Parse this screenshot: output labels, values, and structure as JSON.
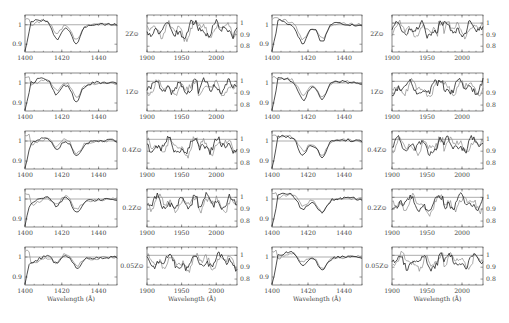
{
  "header": {
    "running_title": "",
    "page_number": ""
  },
  "chart_data": {
    "type": "line",
    "rows": [
      "2Z⊙",
      "1Z⊙",
      "0.4Z⊙",
      "0.2Z⊙",
      "0.05Z⊙"
    ],
    "columns": [
      {
        "window": "short",
        "xlim": [
          1400,
          1450
        ],
        "xticks": [
          1400,
          1420,
          1440
        ],
        "ylim": [
          0.86,
          1.05
        ],
        "yticks": [
          0.9,
          1
        ],
        "ytick_side": "left"
      },
      {
        "window": "long",
        "xlim": [
          1900,
          2030
        ],
        "xticks": [
          1900,
          1950,
          2000
        ],
        "ylim": [
          0.75,
          1.07
        ],
        "yticks": [
          0.8,
          0.9,
          1
        ],
        "ytick_side": "right"
      },
      {
        "window": "short",
        "xlim": [
          1400,
          1450
        ],
        "xticks": [
          1400,
          1420,
          1440
        ],
        "ylim": [
          0.86,
          1.05
        ],
        "yticks": [
          0.9,
          1
        ],
        "ytick_side": "left"
      },
      {
        "window": "long",
        "xlim": [
          1900,
          2030
        ],
        "xticks": [
          1900,
          1950,
          2000
        ],
        "ylim": [
          0.75,
          1.07
        ],
        "yticks": [
          0.8,
          0.9,
          1
        ],
        "ytick_side": "right"
      }
    ],
    "xlabel": "Wavelength (Å)",
    "ylabel": "Normalized flux",
    "reference_line": 1,
    "series_styles": {
      "model": "#222222",
      "comparison": "#888888"
    }
  },
  "labels": {
    "metallicity": [
      "2Z⊙",
      "1Z⊙",
      "0.4Z⊙",
      "0.2Z⊙",
      "0.05Z⊙"
    ],
    "xlabel": "Wavelength (Å)"
  }
}
